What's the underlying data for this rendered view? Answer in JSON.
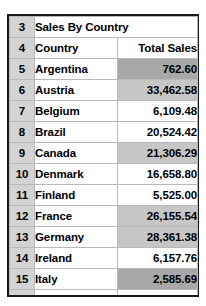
{
  "sheet": {
    "title_row": {
      "row_number": "3",
      "title": "Sales By Country"
    },
    "header_row": {
      "row_number": "4",
      "country_label": "Country",
      "sales_label": "Total Sales"
    },
    "columns": [
      "Country",
      "Total Sales"
    ],
    "rows": [
      {
        "row_number": "5",
        "country": "Argentina",
        "total_sales": "762.60",
        "fill": "dark"
      },
      {
        "row_number": "6",
        "country": "Austria",
        "total_sales": "33,462.58",
        "fill": "light"
      },
      {
        "row_number": "7",
        "country": "Belgium",
        "total_sales": "6,109.48",
        "fill": "none"
      },
      {
        "row_number": "8",
        "country": "Brazil",
        "total_sales": "20,524.42",
        "fill": "none"
      },
      {
        "row_number": "9",
        "country": "Canada",
        "total_sales": "21,306.29",
        "fill": "light"
      },
      {
        "row_number": "10",
        "country": "Denmark",
        "total_sales": "16,658.80",
        "fill": "none"
      },
      {
        "row_number": "11",
        "country": "Finland",
        "total_sales": "5,525.00",
        "fill": "none"
      },
      {
        "row_number": "12",
        "country": "France",
        "total_sales": "26,155.54",
        "fill": "light"
      },
      {
        "row_number": "13",
        "country": "Germany",
        "total_sales": "28,361.38",
        "fill": "light"
      },
      {
        "row_number": "14",
        "country": "Ireland",
        "total_sales": "6,157.76",
        "fill": "none"
      },
      {
        "row_number": "15",
        "country": "Italy",
        "total_sales": "2,585.69",
        "fill": "dark"
      }
    ],
    "colors": {
      "gutter": "#d3d3d3",
      "fill_light": "#c6c6c6",
      "fill_dark": "#a8a8a8",
      "gridline": "#b9b9b9",
      "outer_border": "#1a1a1a"
    }
  },
  "chart_data": {
    "type": "table",
    "title": "Sales By Country",
    "columns": [
      "Country",
      "Total Sales"
    ],
    "categories": [
      "Argentina",
      "Austria",
      "Belgium",
      "Brazil",
      "Canada",
      "Denmark",
      "Finland",
      "France",
      "Germany",
      "Ireland",
      "Italy"
    ],
    "values": [
      762.6,
      33462.58,
      6109.48,
      20524.42,
      21306.29,
      16658.8,
      5525.0,
      26155.54,
      28361.38,
      6157.76,
      2585.69
    ],
    "xlabel": "Country",
    "ylabel": "Total Sales"
  }
}
